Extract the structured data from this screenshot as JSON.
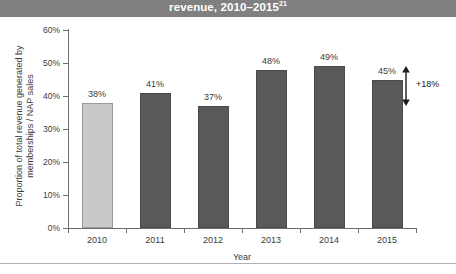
{
  "header": {
    "title_main": "revenue, 2010–2015",
    "title_superscript": "21"
  },
  "chart_data": {
    "type": "bar",
    "title": "revenue, 2010–2015",
    "xlabel": "Year",
    "ylabel": "Proportion of total revenue generated by memberships / NAP sales",
    "categories": [
      "2010",
      "2011",
      "2012",
      "2013",
      "2014",
      "2015"
    ],
    "values": [
      38,
      41,
      37,
      48,
      49,
      45
    ],
    "value_labels": [
      "38%",
      "41%",
      "37%",
      "48%",
      "49%",
      "45%"
    ],
    "series": [
      {
        "name": "Proportion of total revenue generated by memberships / NAP sales",
        "values": [
          38,
          41,
          37,
          48,
          49,
          45
        ]
      }
    ],
    "ylim": [
      0,
      60
    ],
    "ytick_values": [
      60,
      50,
      40,
      30,
      20,
      10,
      0
    ],
    "ytick_labels": [
      "60%",
      "50%",
      "40%",
      "30%",
      "20%",
      "10%",
      "0%"
    ],
    "grid": false,
    "legend": "none",
    "bar_colors": [
      "#c9c9c9",
      "#595959",
      "#595959",
      "#595959",
      "#595959",
      "#595959"
    ],
    "highlight_color": "#c9c9c9",
    "primary_color": "#595959",
    "header_band_color": "#808080",
    "annotations": [
      {
        "text": "+18%",
        "type": "double-arrow",
        "attached_to_category": "2015",
        "meaning": "relative increase from 2010 to 2015"
      }
    ]
  },
  "annotation": {
    "delta_label": "+18%"
  }
}
